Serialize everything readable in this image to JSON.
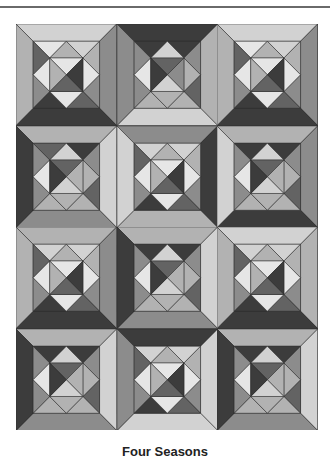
{
  "caption": "Four Seasons",
  "palette": {
    "D": "#3c3c3c",
    "M": "#636363",
    "G": "#8c8c8c",
    "S": "#b2b2b2",
    "L": "#d2d2d2",
    "V": "#e6e6e6"
  },
  "pieces": [
    "T",
    "R",
    "B",
    "Lf",
    "TLt",
    "TLl",
    "TRt",
    "TRr",
    "BRr",
    "BRb",
    "BLb",
    "BLl",
    "Dt",
    "Dr",
    "Db",
    "Dl",
    "Ct",
    "Cr",
    "Cb",
    "Cl"
  ],
  "blocks": [
    {
      "row": 0,
      "col": 0,
      "colors": [
        "L",
        "G",
        "D",
        "S",
        "V",
        "M",
        "L",
        "S",
        "G",
        "M",
        "D",
        "G",
        "S",
        "V",
        "V",
        "V",
        "V",
        "D",
        "M",
        "S"
      ]
    },
    {
      "row": 0,
      "col": 1,
      "colors": [
        "D",
        "S",
        "L",
        "G",
        "D",
        "G",
        "D",
        "G",
        "M",
        "S",
        "S",
        "G",
        "L",
        "S",
        "S",
        "V",
        "M",
        "G",
        "L",
        "D"
      ]
    },
    {
      "row": 0,
      "col": 2,
      "colors": [
        "L",
        "G",
        "D",
        "S",
        "V",
        "M",
        "L",
        "S",
        "G",
        "M",
        "D",
        "G",
        "S",
        "V",
        "V",
        "V",
        "V",
        "D",
        "M",
        "S"
      ]
    },
    {
      "row": 1,
      "col": 0,
      "colors": [
        "S",
        "L",
        "G",
        "D",
        "M",
        "G",
        "D",
        "G",
        "M",
        "S",
        "S",
        "G",
        "L",
        "S",
        "S",
        "V",
        "M",
        "S",
        "L",
        "D"
      ]
    },
    {
      "row": 1,
      "col": 1,
      "colors": [
        "G",
        "D",
        "S",
        "L",
        "L",
        "M",
        "L",
        "S",
        "G",
        "M",
        "D",
        "G",
        "S",
        "V",
        "V",
        "V",
        "V",
        "D",
        "M",
        "S"
      ]
    },
    {
      "row": 1,
      "col": 2,
      "colors": [
        "S",
        "G",
        "D",
        "L",
        "D",
        "G",
        "D",
        "G",
        "M",
        "S",
        "S",
        "G",
        "L",
        "S",
        "S",
        "V",
        "M",
        "S",
        "L",
        "D"
      ]
    },
    {
      "row": 2,
      "col": 0,
      "colors": [
        "S",
        "G",
        "D",
        "S",
        "L",
        "M",
        "L",
        "S",
        "G",
        "M",
        "D",
        "G",
        "S",
        "V",
        "V",
        "V",
        "V",
        "D",
        "M",
        "S"
      ]
    },
    {
      "row": 2,
      "col": 1,
      "colors": [
        "S",
        "L",
        "G",
        "D",
        "D",
        "G",
        "D",
        "G",
        "M",
        "S",
        "S",
        "G",
        "L",
        "S",
        "S",
        "V",
        "M",
        "S",
        "L",
        "D"
      ]
    },
    {
      "row": 2,
      "col": 2,
      "colors": [
        "L",
        "S",
        "D",
        "S",
        "L",
        "M",
        "L",
        "S",
        "G",
        "M",
        "D",
        "G",
        "S",
        "V",
        "V",
        "V",
        "V",
        "D",
        "M",
        "S"
      ]
    },
    {
      "row": 3,
      "col": 0,
      "colors": [
        "S",
        "L",
        "G",
        "D",
        "D",
        "G",
        "D",
        "G",
        "M",
        "S",
        "S",
        "G",
        "L",
        "S",
        "S",
        "V",
        "M",
        "S",
        "L",
        "D"
      ]
    },
    {
      "row": 3,
      "col": 1,
      "colors": [
        "D",
        "L",
        "L",
        "G",
        "L",
        "M",
        "L",
        "S",
        "G",
        "M",
        "D",
        "G",
        "S",
        "V",
        "V",
        "V",
        "V",
        "D",
        "M",
        "S"
      ]
    },
    {
      "row": 3,
      "col": 2,
      "colors": [
        "S",
        "L",
        "G",
        "D",
        "D",
        "G",
        "D",
        "G",
        "M",
        "S",
        "S",
        "G",
        "L",
        "S",
        "S",
        "V",
        "M",
        "S",
        "L",
        "D"
      ]
    }
  ]
}
